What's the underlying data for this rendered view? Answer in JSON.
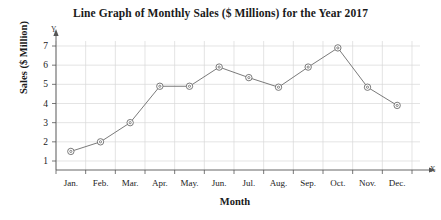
{
  "chart_data": {
    "type": "line",
    "title": "Line Graph of Monthly Sales ($ Millions) for the Year 2017",
    "xlabel": "Month",
    "ylabel": "Sales ($ Million)",
    "categories": [
      "Jan.",
      "Feb.",
      "Mar.",
      "Apr.",
      "May.",
      "Jun.",
      "Jul.",
      "Aug.",
      "Sep.",
      "Oct.",
      "Nov.",
      "Dec."
    ],
    "values": [
      1.5,
      2.0,
      3.0,
      4.9,
      4.9,
      5.9,
      5.35,
      4.85,
      5.9,
      6.9,
      4.85,
      3.9
    ],
    "y_ticks": [
      1,
      2,
      3,
      4,
      5,
      6,
      7
    ],
    "ylim": [
      0,
      7.6
    ],
    "grid": true,
    "legend": "none",
    "axis_letters": {
      "y": "Y",
      "x": "X"
    },
    "series_color": "#6b6b6b",
    "grid_color": "#d8d8d8",
    "axis_color": "#555555",
    "marker": "open-circle"
  }
}
